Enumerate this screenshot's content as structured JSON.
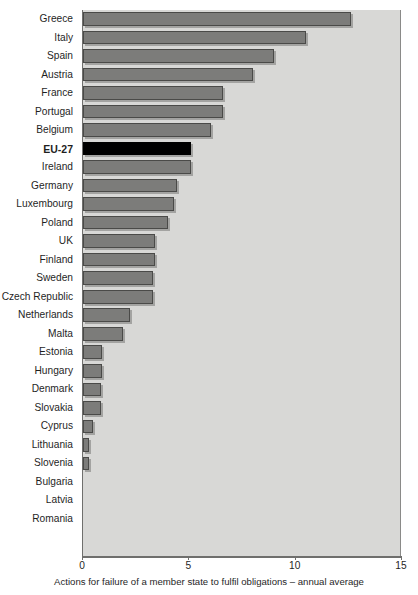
{
  "chart_data": {
    "type": "bar",
    "orientation": "horizontal",
    "title": "",
    "subtitle": "",
    "xlabel": "Actions for failure of a member state to fulfil obligations – annual average",
    "ylabel": "",
    "xlim": [
      0,
      15
    ],
    "xticks": [
      0,
      5,
      10,
      15
    ],
    "xtick_labels": [
      "0",
      "5",
      "10",
      "15"
    ],
    "grid": false,
    "legend": null,
    "highlight_category": "EU-27",
    "colors": {
      "bar": "#7c7c7a",
      "bar_edge": "#4a4a48",
      "highlight_bar": "#000000",
      "plot_background": "#d8d8d6",
      "axis": "#6f6f6d",
      "text": "#1f1f1f"
    },
    "categories": [
      "Greece",
      "Italy",
      "Spain",
      "Austria",
      "France",
      "Portugal",
      "Belgium",
      "EU-27",
      "Ireland",
      "Germany",
      "Luxembourg",
      "Poland",
      "UK",
      "Finland",
      "Sweden",
      "Czech Republic",
      "Netherlands",
      "Malta",
      "Estonia",
      "Hungary",
      "Denmark",
      "Slovakia",
      "Cyprus",
      "Lithuania",
      "Slovenia",
      "Bulgaria",
      "Latvia",
      "Romania"
    ],
    "values": [
      12.6,
      10.5,
      9.0,
      8.0,
      6.6,
      6.6,
      6.0,
      5.1,
      5.1,
      4.4,
      4.3,
      4.0,
      3.4,
      3.4,
      3.3,
      3.3,
      2.2,
      1.9,
      0.9,
      0.9,
      0.85,
      0.85,
      0.45,
      0.3,
      0.3,
      0.0,
      0.0,
      0.0
    ]
  }
}
